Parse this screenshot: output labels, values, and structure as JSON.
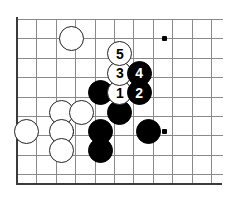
{
  "figure": {
    "kind": "go-board-diagram",
    "title": "",
    "board": {
      "cell_size": 19.4,
      "origin_x": 17,
      "origin_y": 19,
      "cols": 11,
      "rows": 9,
      "line_color": "#8a8a8a",
      "edge_color": "#3a3a3a",
      "background": "#ffffff"
    },
    "star_points": [
      {
        "col": 7.6,
        "row": 1.0
      },
      {
        "col": 7.6,
        "row": 5.8
      },
      {
        "col": 2.8,
        "row": 5.8
      }
    ],
    "stones": [
      {
        "id": "white-upper-left",
        "color": "white",
        "label": "",
        "col": 2.8,
        "row": 1.0
      },
      {
        "id": "white-left-edge",
        "color": "white",
        "label": "",
        "col": 0.5,
        "row": 5.8
      },
      {
        "id": "white-a",
        "color": "white",
        "label": "",
        "col": 2.3,
        "row": 4.8
      },
      {
        "id": "white-b",
        "color": "white",
        "label": "",
        "col": 3.3,
        "row": 4.8
      },
      {
        "id": "white-c",
        "color": "white",
        "label": "",
        "col": 2.3,
        "row": 5.8
      },
      {
        "id": "white-d",
        "color": "white",
        "label": "",
        "col": 2.3,
        "row": 6.8
      },
      {
        "id": "black-a",
        "color": "black",
        "label": "",
        "col": 4.3,
        "row": 3.8
      },
      {
        "id": "black-b",
        "color": "black",
        "label": "",
        "col": 5.3,
        "row": 4.8
      },
      {
        "id": "black-c",
        "color": "black",
        "label": "",
        "col": 4.3,
        "row": 5.8
      },
      {
        "id": "black-d",
        "color": "black",
        "label": "",
        "col": 4.3,
        "row": 6.8
      },
      {
        "id": "black-e",
        "color": "black",
        "label": "",
        "col": 6.8,
        "row": 5.8
      },
      {
        "id": "move-1",
        "color": "white",
        "label": "1",
        "col": 5.3,
        "row": 3.8
      },
      {
        "id": "move-2",
        "color": "black",
        "label": "2",
        "col": 6.3,
        "row": 3.8
      },
      {
        "id": "move-3",
        "color": "white",
        "label": "3",
        "col": 5.3,
        "row": 2.8
      },
      {
        "id": "move-4",
        "color": "black",
        "label": "4",
        "col": 6.3,
        "row": 2.8
      },
      {
        "id": "move-5",
        "color": "white",
        "label": "5",
        "col": 5.3,
        "row": 1.8
      }
    ]
  }
}
